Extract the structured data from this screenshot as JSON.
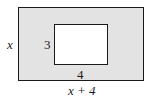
{
  "diagram": {
    "outer_rect": {
      "fill": "#e3e3e3",
      "stroke": "#1a1a1a",
      "height_label": "x",
      "width_label": "x + 4"
    },
    "inner_rect": {
      "fill": "#ffffff",
      "stroke": "#1a1a1a",
      "height_label": "3",
      "width_label": "4"
    }
  }
}
